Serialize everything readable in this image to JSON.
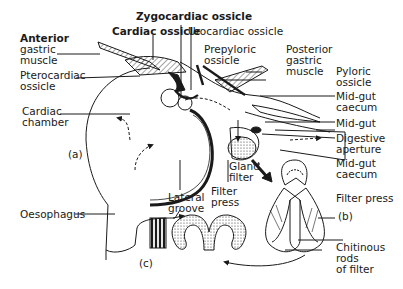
{
  "figure": {
    "panels": [
      "(a)",
      "(b)",
      "(c)"
    ]
  },
  "labels": {
    "zygocardiac_ossicle": "Zygocardiac ossicle",
    "cardiac_ossicle": "Cardiac ossicle",
    "urocardiac_ossicle": "Urocardiac ossicle",
    "anterior_gastric_muscle_1": "Anterior",
    "anterior_gastric_muscle_2": "gastric",
    "anterior_gastric_muscle_3": "muscle",
    "pterocardiac_ossicle_1": "Pterocardiac",
    "pterocardiac_ossicle_2": "ossicle",
    "prepyloric_ossicle_1": "Prepyloric",
    "prepyloric_ossicle_2": "ossicle",
    "posterior_gastric_muscle_1": "Posterior",
    "posterior_gastric_muscle_2": "gastric",
    "posterior_gastric_muscle_3": "muscle",
    "pyloric_ossicle_1": "Pyloric",
    "pyloric_ossicle_2": "ossicle",
    "mid_gut_caecum_1": "Mid-gut",
    "mid_gut_caecum_2": "caecum",
    "mid_gut": "Mid-gut",
    "digestive_aperture_1": "Digestive",
    "digestive_aperture_2": "aperture",
    "cardiac_chamber_1": "Cardiac",
    "cardiac_chamber_2": "chamber",
    "panel_a": "(a)",
    "gland_filter_1": "Gland",
    "gland_filter_2": "filter",
    "filter_press_a_1": "Filter",
    "filter_press_a_2": "press",
    "lateral_groove_1": "Lateral",
    "lateral_groove_2": "groove",
    "oesophagus": "Oesophagus",
    "mid_gut_caecum_b_1": "Mid-gut",
    "mid_gut_caecum_b_2": "caecum",
    "filter_press_b": "Filter press",
    "panel_b": "(b)",
    "chitinous_rods_1": "Chitinous",
    "chitinous_rods_2": "rods",
    "chitinous_rods_3": "of filter",
    "panel_c": "(c)"
  },
  "colors": {
    "ink": "#1a1a1a",
    "background": "#ffffff",
    "shading": "#777777"
  }
}
